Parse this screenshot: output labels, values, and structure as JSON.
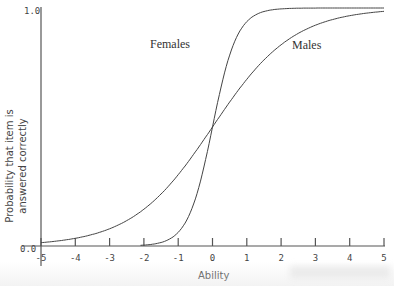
{
  "chart_data": {
    "type": "line",
    "title": "",
    "xlabel": "Ability",
    "ylabel_line1": "Probability that item is",
    "ylabel_line2": "answered correctly",
    "xlim": [
      -5,
      5
    ],
    "ylim": [
      0.0,
      1.0
    ],
    "x_ticks": [
      -5,
      -4,
      -3,
      -2,
      -1,
      0,
      1,
      2,
      3,
      4,
      5
    ],
    "x_tick_labels": [
      "-5",
      "-4",
      "-3",
      "-2",
      "-1",
      "0",
      "1",
      "2",
      "3",
      "4",
      "5"
    ],
    "y_tick_labels": [
      "0.0",
      "1.0"
    ],
    "grid": false,
    "legend": "inline labels on curves",
    "series": [
      {
        "name": "Females",
        "model": "logistic",
        "discrimination": 2.8,
        "difficulty": 0,
        "x": [
          -5,
          -4,
          -3,
          -2,
          -1,
          -0.5,
          0,
          0.5,
          1,
          2,
          3,
          4,
          5
        ],
        "values": [
          0.0,
          0.0,
          0.0,
          0.004,
          0.057,
          0.198,
          0.5,
          0.802,
          0.943,
          0.996,
          1.0,
          1.0,
          1.0
        ]
      },
      {
        "name": "Males",
        "model": "logistic",
        "discrimination": 0.85,
        "difficulty": 0,
        "x": [
          -5,
          -4,
          -3,
          -2,
          -1,
          0,
          1,
          2,
          3,
          4,
          5
        ],
        "values": [
          0.014,
          0.032,
          0.072,
          0.154,
          0.3,
          0.5,
          0.7,
          0.846,
          0.928,
          0.968,
          0.986
        ]
      }
    ],
    "annotations": [
      {
        "text": "Females",
        "x": -0.9,
        "y": 0.83
      },
      {
        "text": "Males",
        "x": 2.3,
        "y": 0.8
      }
    ]
  },
  "labels": {
    "females": "Females",
    "males": "Males",
    "xlabel": "Ability",
    "ylabel_line1": "Probability that item is",
    "ylabel_line2": "answered correctly",
    "y_top": "1.0",
    "y_bottom": "0.0",
    "x_ticks": [
      "-5",
      "-4",
      "-3",
      "-2",
      "-1",
      "0",
      "1",
      "2",
      "3",
      "4",
      "5"
    ]
  }
}
